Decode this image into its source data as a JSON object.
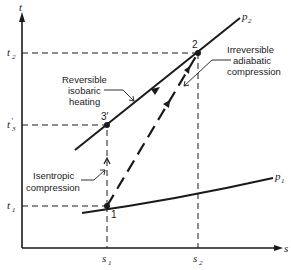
{
  "diagram": {
    "type": "temperature-entropy diagram",
    "axes": {
      "y_label": "t",
      "x_label": "s"
    },
    "y_ticks": [
      {
        "label": "t",
        "sub": "2",
        "prime": "",
        "y": 53
      },
      {
        "label": "t",
        "sub": "3",
        "prime": "′",
        "y": 125
      },
      {
        "label": "t",
        "sub": "1",
        "prime": "",
        "y": 206
      }
    ],
    "x_ticks": [
      {
        "label": "s",
        "sub": "1",
        "x": 107
      },
      {
        "label": "s",
        "sub": "2",
        "x": 198
      }
    ],
    "isobars": [
      {
        "label": "p",
        "sub": "2",
        "from": [
          75,
          150
        ],
        "to": [
          240,
          18
        ]
      },
      {
        "label": "p",
        "sub": "1",
        "from": [
          82,
          213
        ],
        "to": [
          273,
          180
        ]
      }
    ],
    "points": [
      {
        "id": "1",
        "label": "1",
        "x": 107,
        "y": 206
      },
      {
        "id": "3prime",
        "label": "3′",
        "x": 107,
        "y": 125
      },
      {
        "id": "2",
        "label": "2",
        "x": 198,
        "y": 53
      }
    ],
    "processes": [
      {
        "name": "Isentropic compression",
        "from": "1",
        "to": "3prime",
        "style": "dashed-thin"
      },
      {
        "name": "Reversible isobaric heating",
        "from": "3prime",
        "to": "2",
        "style": "solid"
      },
      {
        "name": "Irreversible adiabatic compression",
        "from": "1",
        "to": "2",
        "style": "dashed-heavy"
      }
    ],
    "annotations": {
      "reversible": [
        "Reversible",
        "isobaric",
        "heating"
      ],
      "irreversible": [
        "Irreversible",
        "adiabatic",
        "compression"
      ],
      "isentropic": [
        "Isentropic",
        "compression"
      ]
    },
    "colors": {
      "ink": "#1a1a1a",
      "background": "#ffffff"
    }
  }
}
